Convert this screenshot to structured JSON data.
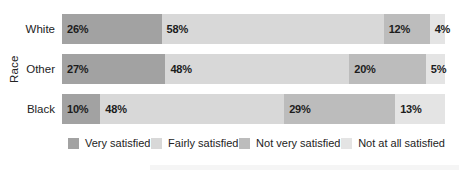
{
  "chart_data": {
    "type": "bar",
    "orientation": "horizontal",
    "stacked": true,
    "title": "",
    "xlabel": "",
    "ylabel": "Race",
    "xlim": [
      0,
      100
    ],
    "grid": false,
    "legend_position": "bottom",
    "value_label_suffix": "%",
    "categories": [
      "White",
      "Other",
      "Black"
    ],
    "series": [
      {
        "name": "Very satisfied",
        "color": "#a2a2a2",
        "values": [
          26,
          27,
          10
        ]
      },
      {
        "name": "Fairly satisfied",
        "color": "#d8d8d8",
        "values": [
          58,
          48,
          48
        ]
      },
      {
        "name": "Not very satisfied",
        "color": "#bcbcbc",
        "values": [
          12,
          20,
          29
        ]
      },
      {
        "name": "Not at all satisfied",
        "color": "#e4e4e4",
        "values": [
          4,
          5,
          13
        ]
      }
    ]
  },
  "colors": {
    "text": "#232323",
    "value_text": "#1c1c1c",
    "background": "#ffffff",
    "artifact_band": "#f5f5f5"
  }
}
